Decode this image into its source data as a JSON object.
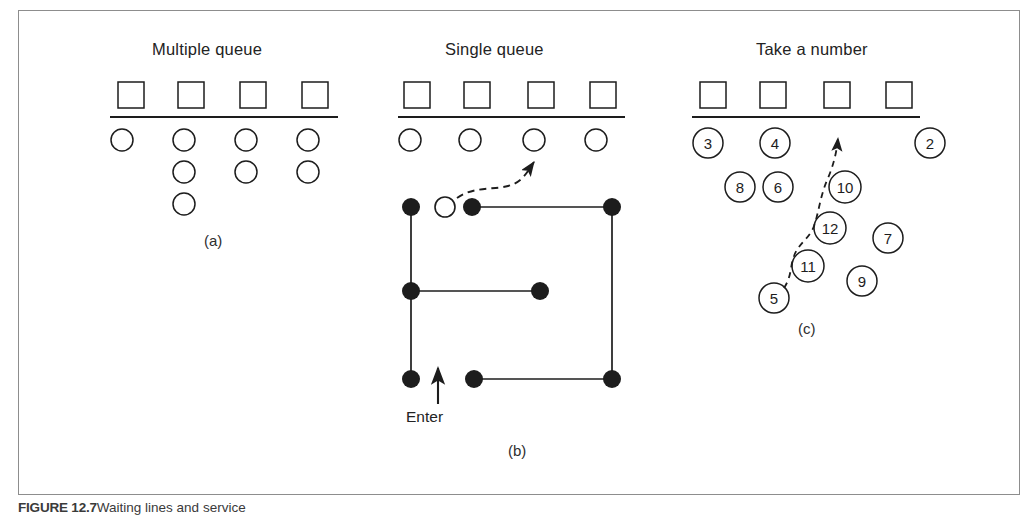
{
  "figure": {
    "caption_bold": "FIGURE 12.7",
    "caption_text": "Waiting lines and service",
    "border_color": "#8d8d8d",
    "ink_color": "#1d1d1d"
  },
  "panels": [
    {
      "id": "a",
      "title": "Multiple queue",
      "label": "(a)",
      "servers": 4,
      "queue_lengths": [
        1,
        3,
        2,
        2
      ],
      "title_x": 152,
      "title_y": 40,
      "label_x": 204,
      "label_y": 232,
      "server_xs": [
        118,
        178,
        240,
        302
      ],
      "server_y": 82,
      "server_size": 26,
      "counter_y": 117,
      "counter_x1": 110,
      "counter_x2": 338,
      "circle_xs": [
        122,
        184,
        246,
        308
      ],
      "circle_y0": 140,
      "circle_dy": 32,
      "circle_r": 11
    },
    {
      "id": "b",
      "title": "Single queue",
      "label": "(b)",
      "enter_label": "Enter",
      "servers": 4,
      "waiting_customers": 4,
      "title_x": 445,
      "title_y": 40,
      "label_x": 508,
      "label_y": 442,
      "server_xs": [
        404,
        464,
        528,
        590
      ],
      "server_y": 82,
      "server_size": 26,
      "counter_y": 117,
      "counter_x1": 398,
      "counter_x2": 625,
      "circle_xs": [
        410,
        470,
        534,
        596
      ],
      "circle_y": 140,
      "circle_r": 11,
      "posts": [
        {
          "x": 411,
          "y": 207
        },
        {
          "x": 472,
          "y": 207
        },
        {
          "x": 612,
          "y": 207
        },
        {
          "x": 411,
          "y": 291
        },
        {
          "x": 540,
          "y": 291
        },
        {
          "x": 411,
          "y": 379
        },
        {
          "x": 474,
          "y": 379
        },
        {
          "x": 612,
          "y": 379
        }
      ],
      "post_r": 9,
      "open_customer": {
        "x": 445,
        "y": 207,
        "r": 10
      },
      "enter_x": 406,
      "enter_y": 408,
      "enter_arrow": {
        "x": 438,
        "y1": 404,
        "y2": 368
      }
    },
    {
      "id": "c",
      "title": "Take a number",
      "label": "(c)",
      "servers": 4,
      "title_x": 756,
      "title_y": 40,
      "label_x": 798,
      "label_y": 320,
      "server_xs": [
        700,
        760,
        824,
        886
      ],
      "server_y": 82,
      "server_size": 26,
      "counter_y": 117,
      "counter_x1": 692,
      "counter_x2": 920,
      "numbered_circles": [
        {
          "n": "3",
          "x": 708,
          "y": 143,
          "r": 15
        },
        {
          "n": "4",
          "x": 775,
          "y": 143,
          "r": 15
        },
        {
          "n": "2",
          "x": 930,
          "y": 143,
          "r": 15
        },
        {
          "n": "8",
          "x": 740,
          "y": 187,
          "r": 15
        },
        {
          "n": "6",
          "x": 778,
          "y": 187,
          "r": 15
        },
        {
          "n": "10",
          "x": 845,
          "y": 187,
          "r": 16
        },
        {
          "n": "12",
          "x": 830,
          "y": 228,
          "r": 16
        },
        {
          "n": "7",
          "x": 888,
          "y": 238,
          "r": 15
        },
        {
          "n": "11",
          "x": 808,
          "y": 266,
          "r": 16
        },
        {
          "n": "9",
          "x": 862,
          "y": 281,
          "r": 15
        },
        {
          "n": "5",
          "x": 774,
          "y": 298,
          "r": 15
        }
      ],
      "arrow_tip": {
        "x": 838,
        "y": 128
      }
    }
  ]
}
